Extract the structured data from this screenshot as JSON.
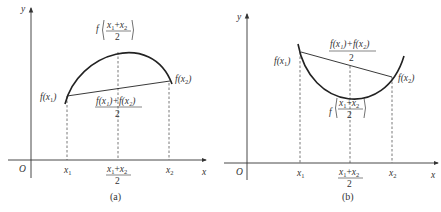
{
  "panels": [
    {
      "id": "a",
      "caption": "(a)",
      "description": "Concave function: midpoint value above chord",
      "axis": {
        "x_label": "x",
        "y_label": "y",
        "origin_label": "O"
      },
      "ticks": {
        "x1": "x",
        "x1_sub": "1",
        "mid_num_a": "x",
        "mid_num_a_sub": "1",
        "mid_plus": "+",
        "mid_num_b": "x",
        "mid_num_b_sub": "2",
        "mid_den": "2",
        "x2": "x",
        "x2_sub": "2"
      },
      "labels": {
        "f_x1": "f(x",
        "f_x1_sub": "1",
        "f_x1_close": ")",
        "f_x2": "f(x",
        "f_x2_sub": "2",
        "f_x2_close": ")",
        "f_mid_prefix": "f",
        "avg_num": "f(x₁)+f(x₂)",
        "avg_den": "2"
      }
    },
    {
      "id": "b",
      "caption": "(b)",
      "description": "Convex function: midpoint value below chord",
      "axis": {
        "x_label": "x",
        "y_label": "y",
        "origin_label": "O"
      },
      "ticks": {
        "x1": "x",
        "x1_sub": "1",
        "mid_num_a": "x",
        "mid_num_a_sub": "1",
        "mid_plus": "+",
        "mid_num_b": "x",
        "mid_num_b_sub": "2",
        "mid_den": "2",
        "x2": "x",
        "x2_sub": "2"
      },
      "labels": {
        "f_x1": "f(x",
        "f_x1_sub": "1",
        "f_x1_close": ")",
        "f_x2": "f(x",
        "f_x2_sub": "2",
        "f_x2_close": ")",
        "f_mid_prefix": "f",
        "avg_num": "f(x₁)+f(x₂)",
        "avg_den": "2"
      }
    }
  ],
  "colors": {
    "line": "#222222",
    "axis": "#333333",
    "dash": "#555555",
    "text": "#333333"
  }
}
